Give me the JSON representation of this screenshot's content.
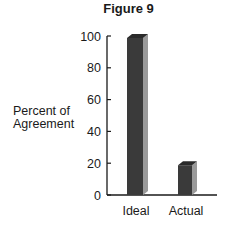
{
  "chart_data": {
    "type": "bar",
    "title": "Figure 9",
    "xlabel": "",
    "ylabel": "Percent of Agreement",
    "ylabel_lines": [
      "Percent of",
      "Agreement"
    ],
    "categories": [
      "Ideal",
      "Actual"
    ],
    "values": [
      100,
      20
    ],
    "ylim": [
      0,
      100
    ],
    "yticks": [
      0,
      20,
      40,
      60,
      80,
      100
    ],
    "grid": false,
    "legend": null,
    "style": "3d-bar",
    "colors": {
      "bar_front": "#3a3a3a",
      "bar_side": "#9a9a9a",
      "bar_top": "#2a2a2a",
      "axis": "#1a1a1a"
    }
  }
}
